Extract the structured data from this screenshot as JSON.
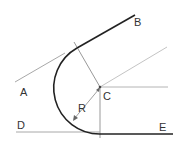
{
  "diagram": {
    "labels": {
      "A": "A",
      "B": "B",
      "C": "C",
      "D": "D",
      "E": "E",
      "R": "R"
    },
    "colors": {
      "construction": "#a8a8a8",
      "result": "#222222",
      "text": "#333333"
    }
  }
}
